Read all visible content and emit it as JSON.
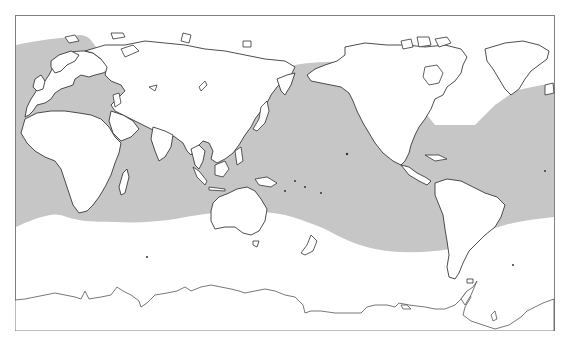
{
  "map": {
    "projection": "Pacific-centered equirectangular world map",
    "frame": {
      "x": 15,
      "y": 15,
      "width": 540,
      "height": 316,
      "stroke": "#808080"
    },
    "colors": {
      "background": "#ffffff",
      "shaded_region": "#c6c6c6",
      "coastline": "#3a3a3a",
      "land": "#ffffff"
    },
    "shaded_region_description": "Gray band covering mid-latitude and tropical oceans (Atlantic, Indian, Pacific) plus Mediterranean and Baltic seas; unshaded polar/high-latitude oceans",
    "regions_shown": [
      "Europe",
      "Africa",
      "Asia",
      "Australia",
      "New Zealand",
      "North America",
      "Greenland",
      "Central America",
      "South America",
      "Antarctica"
    ],
    "text_labels": []
  }
}
